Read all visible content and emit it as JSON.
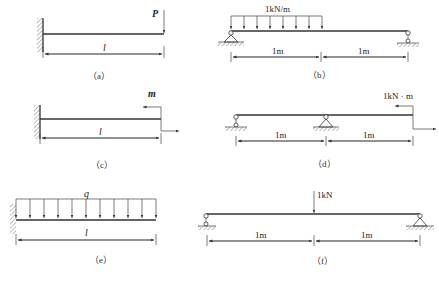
{
  "figures": {
    "a": {
      "caption": "（a）",
      "type": "cantilever",
      "load_label": "P",
      "length_label": "l"
    },
    "b": {
      "caption": "（b）",
      "type": "simply-supported",
      "load_label": "1kN/m",
      "span_left_label": "1m",
      "span_right_label": "1m"
    },
    "c": {
      "caption": "（c）",
      "type": "cantilever",
      "moment_label": "m",
      "length_label": "l"
    },
    "d": {
      "caption": "（d）",
      "type": "overhang",
      "moment_label": "1kN · m",
      "span_left_label": "1m",
      "span_right_label": "1m"
    },
    "e": {
      "caption": "（e）",
      "type": "cantilever",
      "load_label": "q",
      "length_label": "l"
    },
    "f": {
      "caption": "（f）",
      "type": "simply-supported",
      "load_label": "1kN",
      "span_left_label": "1m",
      "span_right_label": "1m"
    }
  }
}
